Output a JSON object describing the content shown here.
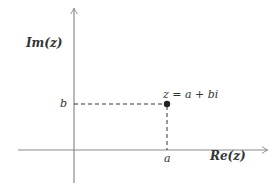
{
  "diagram": {
    "axes": {
      "imaginary_label": "Im(z)",
      "real_label": "Re(z)"
    },
    "point": {
      "label": "z = a + bi",
      "x_tick_label": "a",
      "y_tick_label": "b"
    },
    "colors": {
      "axis": "#8a8a8a",
      "dashed": "#333333",
      "point": "#222222",
      "text": "#333333"
    }
  }
}
